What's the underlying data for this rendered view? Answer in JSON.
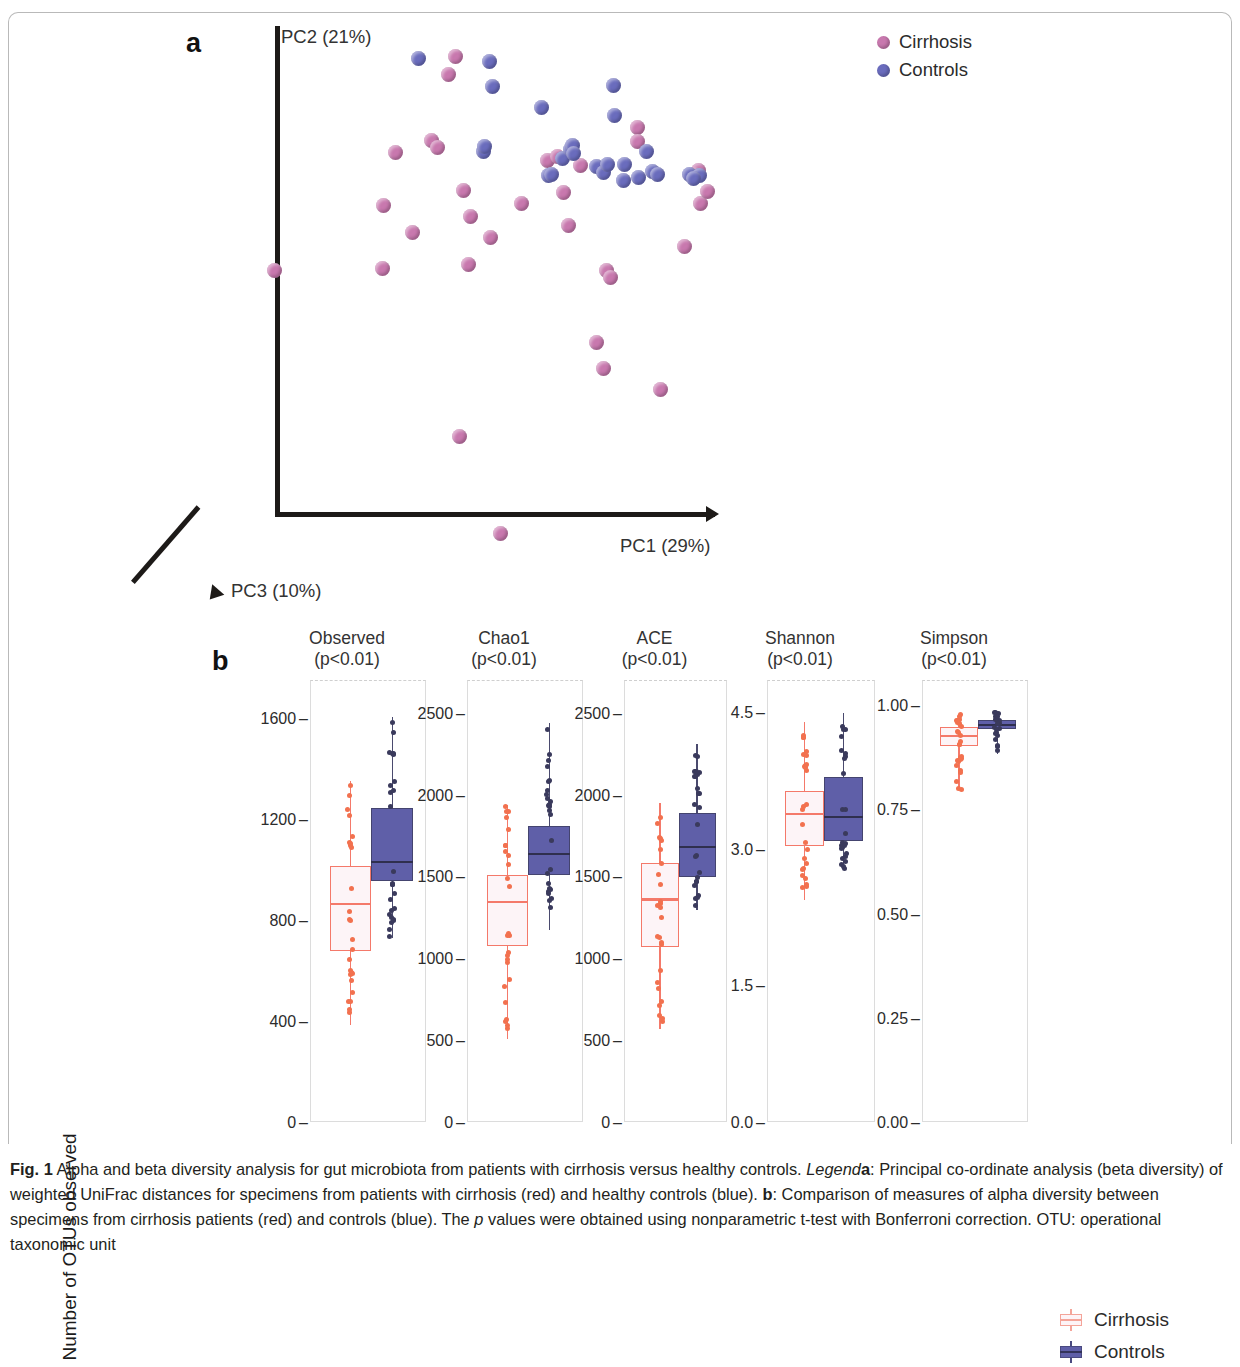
{
  "figure": {
    "panel_a_letter": "a",
    "panel_b_letter": "b"
  },
  "panel_a": {
    "axes": {
      "pc1": "PC1 (29%)",
      "pc2": "PC2 (21%)",
      "pc3": "PC3 (10%)"
    },
    "legend": [
      {
        "label": "Cirrhosis",
        "color": "#c878ae"
      },
      {
        "label": "Controls",
        "color": "#6a6cbd"
      }
    ]
  },
  "panel_b": {
    "ylabel": "Number of OTUs observed",
    "legend": [
      {
        "label": "Cirrhosis",
        "color": "#f4a499"
      },
      {
        "label": "Controls",
        "color": "#5f5fa8"
      }
    ]
  },
  "caption": {
    "prefix": "Fig. 1",
    "line1": " Alpha and beta diversity analysis for gut microbiota from patients with cirrhosis versus healthy controls. ",
    "legend_word": "Legend",
    "a_mark": "a",
    "seg_a": ": Principal co-ordinate analysis (beta diversity) of weighted UniFrac distances for specimens from patients with cirrhosis (red) and healthy controls (blue). ",
    "b_mark": "b",
    "seg_b": ": Comparison of measures of alpha diversity between specimens from cirrhosis patients (red) and controls (blue). The ",
    "p_italic": "p",
    "seg_c": " values were obtained using nonparametric t-test with Bonferroni correction. OTU: operational taxonomic unit"
  },
  "chart_data": [
    {
      "type": "scatter",
      "title": "Principal co-ordinate analysis (beta diversity) of weighted UniFrac distances",
      "xlabel": "PC1 (29%)",
      "ylabel": "PC2 (21%)",
      "zlabel": "PC3 (10%)",
      "grid": false,
      "legend_position": "top-right",
      "series": [
        {
          "name": "Cirrhosis",
          "color": "#c878ae",
          "points": [
            [
              455,
              29
            ],
            [
              448,
              47
            ],
            [
              637,
              100
            ],
            [
              395,
              125
            ],
            [
              431,
              113
            ],
            [
              437,
              120
            ],
            [
              383,
              178
            ],
            [
              463,
              163
            ],
            [
              470,
              189
            ],
            [
              490,
              210
            ],
            [
              412,
              205
            ],
            [
              468,
              237
            ],
            [
              382,
              241
            ],
            [
              274,
              243
            ],
            [
              568,
              198
            ],
            [
              606,
              243
            ],
            [
              610,
              250
            ],
            [
              547,
              133
            ],
            [
              557,
              129
            ],
            [
              684,
              219
            ],
            [
              700,
              176
            ],
            [
              707,
              164
            ],
            [
              637,
              114
            ],
            [
              698,
              143
            ],
            [
              694,
              147
            ],
            [
              521,
              176
            ],
            [
              596,
              315
            ],
            [
              603,
              341
            ],
            [
              660,
              362
            ],
            [
              459,
              409
            ],
            [
              500,
              506
            ],
            [
              563,
              165
            ],
            [
              580,
              138
            ]
          ]
        },
        {
          "name": "Controls",
          "color": "#6a6cbd",
          "points": [
            [
              418,
              31
            ],
            [
              489,
              34
            ],
            [
              492,
              59
            ],
            [
              541,
              80
            ],
            [
              614,
              88
            ],
            [
              613,
              58
            ],
            [
              562,
              131
            ],
            [
              548,
              148
            ],
            [
              551,
              147
            ],
            [
              596,
              139
            ],
            [
              603,
              145
            ],
            [
              607,
              137
            ],
            [
              624,
              137
            ],
            [
              646,
              124
            ],
            [
              652,
              144
            ],
            [
              657,
              147
            ],
            [
              638,
              150
            ],
            [
              689,
              147
            ],
            [
              699,
              148
            ],
            [
              693,
              151
            ],
            [
              483,
              124
            ],
            [
              484,
              119
            ],
            [
              623,
              153
            ],
            [
              570,
              122
            ],
            [
              572,
              118
            ],
            [
              573,
              126
            ]
          ]
        }
      ]
    },
    {
      "type": "box",
      "title": "Alpha diversity measures",
      "ylabel": "Number of OTUs observed",
      "groups": [
        "Cirrhosis",
        "Controls"
      ],
      "panels": [
        {
          "name": "Observed",
          "pvalue": "(p<0.01)",
          "title_line1": "Observed",
          "title_line2": "(p<0.01)",
          "ymin": 0,
          "ymax": 1750,
          "ticks": [
            0,
            400,
            800,
            1200,
            1600
          ],
          "tick_labels": [
            "0",
            "400",
            "800",
            "1200",
            "1600"
          ],
          "boxes": [
            {
              "group": "Cirrhosis",
              "min": 380,
              "q1": 675,
              "median": 865,
              "q3": 1010,
              "max": 1345
            },
            {
              "group": "Controls",
              "min": 725,
              "q1": 950,
              "median": 1030,
              "q3": 1240,
              "max": 1600
            }
          ]
        },
        {
          "name": "Chao1",
          "pvalue": "(p<0.01)",
          "title_line1": "Chao1",
          "title_line2": "(p<0.01)",
          "ymin": 0,
          "ymax": 2700,
          "ticks": [
            0,
            500,
            1000,
            1500,
            2000,
            2500
          ],
          "tick_labels": [
            "0",
            "500",
            "1000",
            "1500",
            "2000",
            "2500"
          ],
          "boxes": [
            {
              "group": "Cirrhosis",
              "min": 500,
              "q1": 1070,
              "median": 1345,
              "q3": 1500,
              "max": 1930
            },
            {
              "group": "Controls",
              "min": 1165,
              "q1": 1500,
              "median": 1640,
              "q3": 1800,
              "max": 2430
            }
          ]
        },
        {
          "name": "ACE",
          "pvalue": "(p<0.01)",
          "title_line1": "ACE",
          "title_line2": "(p<0.01)",
          "ymin": 0,
          "ymax": 2700,
          "ticks": [
            0,
            500,
            1000,
            1500,
            2000,
            2500
          ],
          "tick_labels": [
            "0",
            "500",
            "1000",
            "1500",
            "2000",
            "2500"
          ],
          "boxes": [
            {
              "group": "Cirrhosis",
              "min": 565,
              "q1": 1060,
              "median": 1360,
              "q3": 1575,
              "max": 1945
            },
            {
              "group": "Controls",
              "min": 1290,
              "q1": 1490,
              "median": 1680,
              "q3": 1880,
              "max": 2300
            }
          ]
        },
        {
          "name": "Shannon",
          "pvalue": "(p<0.01)",
          "title_line1": "Shannon",
          "title_line2": "(p<0.01)",
          "ymin": 0.0,
          "ymax": 4.85,
          "ticks": [
            0.0,
            1.5,
            3.0,
            4.5
          ],
          "tick_labels": [
            "0.0",
            "1.5",
            "3.0",
            "4.5"
          ],
          "boxes": [
            {
              "group": "Cirrhosis",
              "min": 2.42,
              "q1": 3.02,
              "median": 3.38,
              "q3": 3.62,
              "max": 4.38
            },
            {
              "group": "Controls",
              "min": 2.75,
              "q1": 3.07,
              "median": 3.35,
              "q3": 3.78,
              "max": 4.48
            }
          ]
        },
        {
          "name": "Simpson",
          "pvalue": "(p<0.01)",
          "title_line1": "Simpson",
          "title_line2": "(p<0.01)",
          "ymin": 0.0,
          "ymax": 1.06,
          "ticks": [
            0.0,
            0.25,
            0.5,
            0.75,
            1.0
          ],
          "tick_labels": [
            "0.00",
            "0.25",
            "0.50",
            "0.75",
            "1.00"
          ],
          "boxes": [
            {
              "group": "Cirrhosis",
              "min": 0.795,
              "q1": 0.9,
              "median": 0.925,
              "q3": 0.945,
              "max": 0.975
            },
            {
              "group": "Controls",
              "min": 0.88,
              "q1": 0.94,
              "median": 0.952,
              "q3": 0.962,
              "max": 0.98
            }
          ]
        }
      ]
    }
  ]
}
